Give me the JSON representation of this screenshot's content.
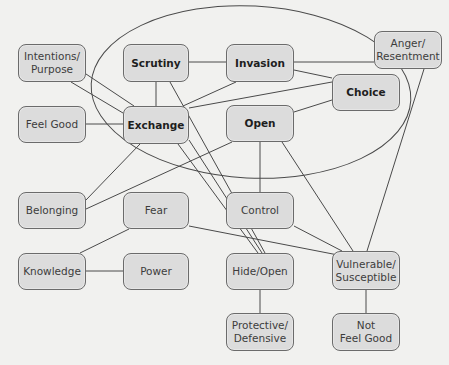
{
  "diagram": {
    "title": "",
    "nodes": [
      {
        "id": "intentions",
        "label": "Intentions/\nPurpose",
        "bold": false,
        "x": 18,
        "y": 44,
        "w": 68,
        "h": 38
      },
      {
        "id": "scrutiny",
        "label": "Scrutiny",
        "bold": true,
        "x": 123,
        "y": 44,
        "w": 66,
        "h": 38
      },
      {
        "id": "invasion",
        "label": "Invasion",
        "bold": true,
        "x": 226,
        "y": 44,
        "w": 68,
        "h": 38
      },
      {
        "id": "anger",
        "label": "Anger/\nResentment",
        "bold": false,
        "x": 374,
        "y": 31,
        "w": 68,
        "h": 38
      },
      {
        "id": "choice",
        "label": "Choice",
        "bold": true,
        "x": 332,
        "y": 74,
        "w": 68,
        "h": 37
      },
      {
        "id": "feel_good",
        "label": "Feel Good",
        "bold": false,
        "x": 18,
        "y": 106,
        "w": 68,
        "h": 37
      },
      {
        "id": "exchange",
        "label": "Exchange",
        "bold": true,
        "x": 123,
        "y": 106,
        "w": 66,
        "h": 38
      },
      {
        "id": "open",
        "label": "Open",
        "bold": true,
        "x": 226,
        "y": 105,
        "w": 68,
        "h": 37
      },
      {
        "id": "belonging",
        "label": "Belonging",
        "bold": false,
        "x": 18,
        "y": 192,
        "w": 68,
        "h": 37
      },
      {
        "id": "fear",
        "label": "Fear",
        "bold": false,
        "x": 123,
        "y": 192,
        "w": 66,
        "h": 37
      },
      {
        "id": "control",
        "label": "Control",
        "bold": false,
        "x": 226,
        "y": 192,
        "w": 68,
        "h": 37
      },
      {
        "id": "knowledge",
        "label": "Knowledge",
        "bold": false,
        "x": 18,
        "y": 253,
        "w": 68,
        "h": 37
      },
      {
        "id": "power",
        "label": "Power",
        "bold": false,
        "x": 123,
        "y": 253,
        "w": 66,
        "h": 37
      },
      {
        "id": "hide_open",
        "label": "Hide/Open",
        "bold": false,
        "x": 226,
        "y": 253,
        "w": 68,
        "h": 37
      },
      {
        "id": "vulnerable",
        "label": "Vulnerable/\nSusceptible",
        "bold": false,
        "x": 332,
        "y": 251,
        "w": 68,
        "h": 39
      },
      {
        "id": "protective",
        "label": "Protective/\nDefensive",
        "bold": false,
        "x": 226,
        "y": 313,
        "w": 68,
        "h": 38
      },
      {
        "id": "not_feel_good",
        "label": "Not\nFeel Good",
        "bold": false,
        "x": 332,
        "y": 313,
        "w": 68,
        "h": 38
      }
    ],
    "edges": [
      {
        "from": "intentions",
        "to": "exchange",
        "points": [
          86,
          74,
          134,
          106
        ]
      },
      {
        "from": "intentions",
        "to": "exchange",
        "points": [
          71,
          82,
          123,
          113
        ]
      },
      {
        "from": "feel_good",
        "to": "exchange",
        "points": [
          86,
          124,
          123,
          124
        ]
      },
      {
        "from": "scrutiny",
        "to": "exchange",
        "points": [
          156,
          82,
          156,
          106
        ]
      },
      {
        "from": "scrutiny",
        "to": "invasion",
        "points": [
          189,
          62,
          226,
          62
        ]
      },
      {
        "from": "invasion",
        "to": "anger",
        "points": [
          294,
          62,
          374,
          62
        ]
      },
      {
        "from": "invasion",
        "to": "exchange",
        "points": [
          236,
          82,
          183,
          106
        ]
      },
      {
        "from": "invasion",
        "to": "choice",
        "points": [
          294,
          70,
          332,
          78
        ]
      },
      {
        "from": "exchange",
        "to": "choice",
        "points": [
          189,
          108,
          332,
          82
        ]
      },
      {
        "from": "open",
        "to": "choice",
        "points": [
          294,
          112,
          332,
          100
        ]
      },
      {
        "from": "exchange",
        "to": "belonging",
        "points": [
          140,
          144,
          86,
          200
        ]
      },
      {
        "from": "open",
        "to": "belonging",
        "points": [
          232,
          142,
          86,
          209
        ]
      },
      {
        "from": "scrutiny",
        "to": "hide_open",
        "points": [
          170,
          82,
          265,
          253
        ]
      },
      {
        "from": "exchange",
        "to": "hide_open",
        "points": [
          178,
          144,
          258,
          253
        ]
      },
      {
        "from": "exchange",
        "to": "hide_open",
        "points": [
          189,
          140,
          262,
          253
        ]
      },
      {
        "from": "open",
        "to": "control",
        "points": [
          260,
          142,
          260,
          192
        ]
      },
      {
        "from": "open",
        "to": "vulnerable",
        "points": [
          282,
          142,
          353,
          251
        ]
      },
      {
        "from": "anger",
        "to": "vulnerable",
        "points": [
          424,
          69,
          367,
          251
        ]
      },
      {
        "from": "control",
        "to": "vulnerable",
        "points": [
          294,
          226,
          342,
          251
        ]
      },
      {
        "from": "fear",
        "to": "vulnerable",
        "points": [
          189,
          226,
          338,
          255
        ]
      },
      {
        "from": "fear",
        "to": "knowledge",
        "points": [
          129,
          229,
          80,
          253
        ]
      },
      {
        "from": "knowledge",
        "to": "power",
        "points": [
          86,
          271,
          123,
          271
        ]
      },
      {
        "from": "hide_open",
        "to": "protective",
        "points": [
          260,
          290,
          260,
          313
        ]
      },
      {
        "from": "vulnerable",
        "to": "not_feel_good",
        "points": [
          366,
          290,
          366,
          313
        ]
      }
    ],
    "ellipse": {
      "cx": 251,
      "cy": 92,
      "rx": 160,
      "ry": 86,
      "rotate": 3
    },
    "colors": {
      "background": "#f1f1ef",
      "node_fill": "#dcdcdc",
      "node_border": "#6b6b6b",
      "line": "#4a4a4a"
    }
  }
}
